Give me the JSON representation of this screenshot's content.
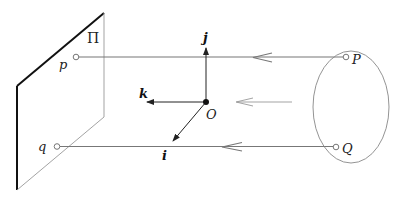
{
  "diagram": {
    "type": "orthographic-projection",
    "plane_label": "Π",
    "axes": {
      "i": "i",
      "j": "j",
      "k": "k",
      "origin": "O"
    },
    "image_points": {
      "p": "p",
      "q": "q"
    },
    "object_points": {
      "P": "P",
      "Q": "Q"
    },
    "colors": {
      "plane_edge_bold": "#111111",
      "plane_edge_thin": "#888888",
      "projection_ray": "#777777",
      "axis": "#222222",
      "ellipse": "#888888"
    }
  }
}
